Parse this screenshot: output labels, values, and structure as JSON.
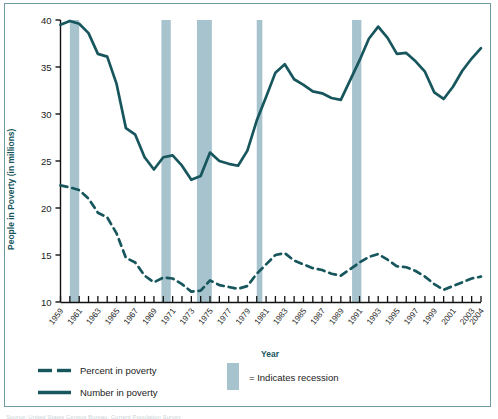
{
  "figure": {
    "border_color": "#6f9aa2",
    "background": "#ffffff",
    "source_note": "Source: United States Census Bureau, Current Population Survey"
  },
  "legend": {
    "percent_label": "Percent in poverty",
    "number_label": "Number in poverty",
    "recession_label": "= Indicates recession",
    "recession_swatch_name": "recession-swatch"
  },
  "colors": {
    "line": "#17565c",
    "recession_band": "#a7c4ce",
    "axis": "#111111",
    "axis_title": "#17565c"
  },
  "chart_data": {
    "type": "line",
    "title": "",
    "xlabel": "Year",
    "ylabel": "People in Poverty (in millions)",
    "ylim": [
      10,
      40
    ],
    "yticks": [
      10,
      15,
      20,
      25,
      30,
      35,
      40
    ],
    "ytick_labels": [
      "10",
      "15",
      "20",
      "25",
      "30",
      "35",
      "40"
    ],
    "xlim": [
      1959,
      2004
    ],
    "grid": false,
    "legend_position": "below-axes",
    "x": [
      1959,
      1960,
      1961,
      1962,
      1963,
      1964,
      1965,
      1966,
      1967,
      1968,
      1969,
      1970,
      1971,
      1972,
      1973,
      1974,
      1975,
      1976,
      1977,
      1978,
      1979,
      1980,
      1981,
      1982,
      1983,
      1984,
      1985,
      1986,
      1987,
      1988,
      1989,
      1990,
      1991,
      1992,
      1993,
      1994,
      1995,
      1996,
      1997,
      1998,
      1999,
      2000,
      2001,
      2002,
      2003,
      2004
    ],
    "xtick_labels": [
      "1959",
      "",
      "1961",
      "",
      "1963",
      "",
      "1965",
      "",
      "1967",
      "",
      "1969",
      "",
      "1971",
      "",
      "1973",
      "",
      "1975",
      "",
      "1977",
      "",
      "1979",
      "",
      "1981",
      "",
      "1983",
      "",
      "1985",
      "",
      "1987",
      "",
      "1989",
      "",
      "1991",
      "",
      "1993",
      "",
      "1995",
      "",
      "1997",
      "",
      "1999",
      "",
      "2001",
      "",
      "2003",
      "2004"
    ],
    "series": [
      {
        "name": "Number in poverty",
        "style": "solid",
        "unit": "millions",
        "values": [
          39.5,
          39.9,
          39.6,
          38.6,
          36.4,
          36.1,
          33.2,
          28.5,
          27.8,
          25.4,
          24.1,
          25.4,
          25.6,
          24.5,
          23.0,
          23.4,
          25.9,
          25.0,
          24.7,
          24.5,
          26.1,
          29.3,
          31.8,
          34.4,
          35.3,
          33.7,
          33.1,
          32.4,
          32.2,
          31.7,
          31.5,
          33.6,
          35.7,
          38.0,
          39.3,
          38.1,
          36.4,
          36.5,
          35.6,
          34.5,
          32.3,
          31.6,
          32.9,
          34.6,
          35.9,
          37.0
        ]
      },
      {
        "name": "Percent in poverty",
        "style": "dashed",
        "unit": "percent",
        "values": [
          22.4,
          22.2,
          21.9,
          21.0,
          19.5,
          19.0,
          17.3,
          14.7,
          14.2,
          12.8,
          12.1,
          12.6,
          12.5,
          11.9,
          11.1,
          11.2,
          12.3,
          11.8,
          11.6,
          11.4,
          11.7,
          13.0,
          14.0,
          15.0,
          15.2,
          14.4,
          14.0,
          13.6,
          13.4,
          13.0,
          12.8,
          13.5,
          14.2,
          14.8,
          15.1,
          14.5,
          13.8,
          13.7,
          13.3,
          12.7,
          11.9,
          11.3,
          11.7,
          12.1,
          12.5,
          12.7
        ]
      }
    ],
    "recessions": [
      {
        "start": 1960.0,
        "end": 1961.0
      },
      {
        "start": 1969.8,
        "end": 1970.8
      },
      {
        "start": 1973.6,
        "end": 1975.2
      },
      {
        "start": 1980.0,
        "end": 1980.6
      },
      {
        "start": 1990.2,
        "end": 1991.2
      }
    ]
  }
}
